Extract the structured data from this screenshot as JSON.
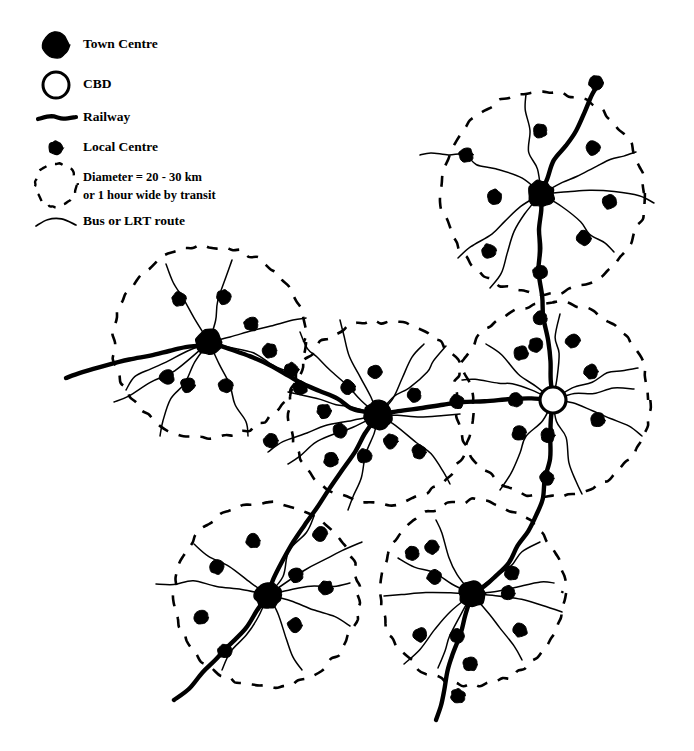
{
  "figure": {
    "kind": "transit-oriented-urban-structure-diagram",
    "background_color": "#ffffff",
    "ink_color": "#000000",
    "width": 694,
    "height": 751
  },
  "legend": {
    "items": [
      {
        "id": "town-centre",
        "label": "Town Centre",
        "symbol": "filled-large-circle",
        "symbol_radius": 13,
        "symbol_x": 56,
        "symbol_y": 45,
        "text_x": 83,
        "text_y": 45,
        "fill": "#000000"
      },
      {
        "id": "cbd",
        "label": "CBD",
        "symbol": "hollow-large-circle",
        "symbol_radius": 13,
        "symbol_x": 56,
        "symbol_y": 85,
        "text_x": 83,
        "text_y": 85,
        "fill": "#ffffff"
      },
      {
        "id": "railway",
        "label": "Railway",
        "symbol": "thick-line",
        "symbol_x": 38,
        "symbol_y": 118,
        "symbol_x2": 76,
        "text_x": 83,
        "text_y": 118,
        "stroke_width": 4.2
      },
      {
        "id": "local-centre",
        "label": "Local Centre",
        "symbol": "filled-small-circle",
        "symbol_radius": 7,
        "symbol_x": 56,
        "symbol_y": 148,
        "text_x": 83,
        "text_y": 148,
        "fill": "#000000"
      },
      {
        "id": "catchment-circle",
        "label": "Diameter = 20 - 30 km",
        "label_line2": "or 1 hour wide by transit",
        "symbol": "dashed-circle",
        "symbol_radius": 21,
        "symbol_x": 56,
        "symbol_y": 185,
        "text_x": 83,
        "text_y": 178,
        "text2_y": 196
      },
      {
        "id": "bus-lrt-route",
        "label": "Bus or LRT route",
        "symbol": "thin-line",
        "symbol_x": 36,
        "symbol_y": 222,
        "symbol_x2": 76,
        "text_x": 83,
        "text_y": 222,
        "stroke_width": 1.4
      }
    ]
  },
  "map": {
    "town_centres": [
      {
        "id": "tc-north-east",
        "x": 541,
        "y": 194,
        "r": 13
      },
      {
        "id": "tc-west",
        "x": 209,
        "y": 342,
        "r": 13
      },
      {
        "id": "tc-central",
        "x": 378,
        "y": 415,
        "r": 14
      },
      {
        "id": "tc-south-west",
        "x": 268,
        "y": 595,
        "r": 13
      },
      {
        "id": "tc-south-east",
        "x": 472,
        "y": 594,
        "r": 13
      }
    ],
    "cbd": {
      "id": "cbd-node",
      "x": 553,
      "y": 400,
      "r": 13
    },
    "catchment_circles": [
      {
        "id": "circle-north-east",
        "cx": 543,
        "cy": 193,
        "r": 101
      },
      {
        "id": "circle-west",
        "cx": 209,
        "cy": 342,
        "r": 96
      },
      {
        "id": "circle-central",
        "cx": 381,
        "cy": 413,
        "r": 92
      },
      {
        "id": "circle-cbd",
        "cx": 552,
        "cy": 400,
        "r": 97
      },
      {
        "id": "circle-south-west",
        "cx": 267,
        "cy": 595,
        "r": 92
      },
      {
        "id": "circle-south-east",
        "cx": 472,
        "cy": 593,
        "r": 92
      }
    ],
    "railways": [
      {
        "id": "railway-west-trunk",
        "points": "66,378 84,372 106,366 128,360 150,355 168,351 186,347 200,344 209,342",
        "stroke_width": 4.4
      },
      {
        "id": "railway-west-to-central",
        "points": "209,342 229,348 250,356 270,366 289,375 305,383 320,392 336,400 352,408 366,412 378,415",
        "stroke_width": 4.4
      },
      {
        "id": "railway-central-to-cbd",
        "points": "378,415 398,411 420,407 442,404 464,402 486,400 510,399 532,399 553,400",
        "stroke_width": 4.4
      },
      {
        "id": "railway-cbd-north",
        "points": "553,400 552,380 550,360 547,340 544,318 542,296 540,272 540,250 540,228 540,210 541,194",
        "stroke_width": 4.4
      },
      {
        "id": "railway-north-spur",
        "points": "541,194 547,178 555,162 565,146 575,130 585,112 593,96 600,82",
        "stroke_width": 4.4
      },
      {
        "id": "railway-cbd-south",
        "points": "553,400 552,420 551,440 549,460 546,480 542,498 536,514 528,530 518,546 508,562 496,576 484,586 472,594",
        "stroke_width": 4.4
      },
      {
        "id": "railway-south-east-tail",
        "points": "472,594 466,614 460,634 454,654 449,672 444,690 440,706 436,720",
        "stroke_width": 4.4
      },
      {
        "id": "railway-central-to-sw",
        "points": "378,415 366,434 354,452 342,470 330,488 318,506 306,524 294,542 282,560 274,578 268,595",
        "stroke_width": 4.4
      },
      {
        "id": "railway-sw-tail",
        "points": "268,595 256,612 244,628 230,644 216,660 202,674 188,688 174,700",
        "stroke_width": 4.4
      }
    ],
    "local_centres": [
      {
        "x": 596,
        "y": 83
      },
      {
        "x": 540,
        "y": 131
      },
      {
        "x": 466,
        "y": 155
      },
      {
        "x": 593,
        "y": 148
      },
      {
        "x": 609,
        "y": 202
      },
      {
        "x": 495,
        "y": 197
      },
      {
        "x": 584,
        "y": 238
      },
      {
        "x": 489,
        "y": 251
      },
      {
        "x": 540,
        "y": 272
      },
      {
        "x": 540,
        "y": 318
      },
      {
        "x": 521,
        "y": 353
      },
      {
        "x": 573,
        "y": 341
      },
      {
        "x": 591,
        "y": 372
      },
      {
        "x": 516,
        "y": 400
      },
      {
        "x": 457,
        "y": 402
      },
      {
        "x": 598,
        "y": 420
      },
      {
        "x": 519,
        "y": 433
      },
      {
        "x": 548,
        "y": 435
      },
      {
        "x": 547,
        "y": 478
      },
      {
        "x": 536,
        "y": 345
      },
      {
        "x": 414,
        "y": 395
      },
      {
        "x": 348,
        "y": 387
      },
      {
        "x": 375,
        "y": 372
      },
      {
        "x": 391,
        "y": 441
      },
      {
        "x": 340,
        "y": 431
      },
      {
        "x": 365,
        "y": 456
      },
      {
        "x": 419,
        "y": 452
      },
      {
        "x": 331,
        "y": 460
      },
      {
        "x": 324,
        "y": 411
      },
      {
        "x": 300,
        "y": 388
      },
      {
        "x": 179,
        "y": 299
      },
      {
        "x": 224,
        "y": 297
      },
      {
        "x": 251,
        "y": 324
      },
      {
        "x": 167,
        "y": 377
      },
      {
        "x": 188,
        "y": 385
      },
      {
        "x": 226,
        "y": 386
      },
      {
        "x": 270,
        "y": 351
      },
      {
        "x": 291,
        "y": 370
      },
      {
        "x": 271,
        "y": 441
      },
      {
        "x": 320,
        "y": 534
      },
      {
        "x": 253,
        "y": 541
      },
      {
        "x": 217,
        "y": 567
      },
      {
        "x": 201,
        "y": 617
      },
      {
        "x": 295,
        "y": 625
      },
      {
        "x": 326,
        "y": 588
      },
      {
        "x": 296,
        "y": 575
      },
      {
        "x": 225,
        "y": 651
      },
      {
        "x": 412,
        "y": 553
      },
      {
        "x": 432,
        "y": 547
      },
      {
        "x": 434,
        "y": 577
      },
      {
        "x": 512,
        "y": 573
      },
      {
        "x": 508,
        "y": 593
      },
      {
        "x": 420,
        "y": 635
      },
      {
        "x": 457,
        "y": 636
      },
      {
        "x": 470,
        "y": 664
      },
      {
        "x": 520,
        "y": 630
      },
      {
        "x": 458,
        "y": 696
      }
    ],
    "bus_routes": [
      "541,194 536,172 532,150 529,128 527,108 526,94",
      "541,194 519,181 498,170 478,162 466,155 450,152 434,152 420,155",
      "541,194 561,183 580,173 594,165 608,158 622,154 636,152",
      "541,194 566,192 590,192 614,194 636,198 654,203",
      "541,194 562,208 580,222 592,234 602,244 614,252",
      "541,194 521,208 504,222 490,236 474,248 458,258",
      "541,194 527,214 516,234 506,254 498,272 490,288",
      "541,194 540,216 540,240 540,262 540,284",
      "553,400 533,392 514,386 496,382 478,380 462,380",
      "553,400 572,389 590,380 606,374 622,370 638,368",
      "553,400 573,405 594,412 612,420 628,428 642,436",
      "553,400 558,420 564,440 570,460 576,478 582,494",
      "553,400 540,419 528,438 518,456 508,474 500,490",
      "553,400 554,378 556,356 558,334 560,314",
      "553,400 534,386 516,372 500,358 486,344",
      "553,400 575,396 596,392 616,390 634,389",
      "378,415 360,400 344,386 330,372 318,358 308,346 300,332",
      "378,415 356,408 336,402 318,398 302,394 288,392",
      "378,415 394,400 410,386 424,372 436,358 446,346",
      "378,415 400,414 422,414 442,414 460,414",
      "378,415 396,428 414,442 428,456 440,470 450,484",
      "378,415 372,436 366,456 360,476 354,494 348,510",
      "378,415 356,424 336,434 318,444 302,454 288,464",
      "378,415 368,394 358,374 350,354 344,336 340,320",
      "378,415 390,396 402,378 414,360 424,344",
      "378,415 352,418 328,424 306,432 286,442 268,452",
      "209,342 196,322 184,302 174,282 166,264",
      "209,342 214,320 220,298 226,278 232,260",
      "209,342 232,334 254,328 274,324 290,320 306,318",
      "209,342 230,348 252,356 272,364 290,372",
      "209,342 220,362 230,382 238,402 244,420 248,436",
      "209,342 196,362 184,382 174,402 166,420 160,436",
      "209,342 188,350 168,360 152,370 138,380 126,390",
      "209,342 172,370 150,384 132,394 114,402",
      "268,595 280,574 292,554 304,534 314,516",
      "268,595 248,580 228,566 210,554 194,544",
      "268,595 242,589 216,585 192,583 172,583 156,584",
      "268,595 290,590 312,586 332,584 350,583",
      "268,595 292,602 314,610 334,618 350,626",
      "268,595 278,616 288,636 296,654 302,670",
      "268,595 256,616 244,636 232,654 222,670",
      "268,595 302,572 324,560 344,550 362,542",
      "472,594 460,574 450,554 442,536 436,520",
      "472,594 452,582 432,572 414,564 398,558",
      "472,594 448,592 424,592 402,594 384,596",
      "472,594 496,590 518,586 538,584 554,583",
      "472,594 498,596 522,600 544,606 562,612",
      "472,594 486,612 500,630 512,646 522,660",
      "472,594 462,614 452,634 444,652 438,668",
      "472,594 452,612 434,630 418,648 404,664",
      "472,594 490,578 508,564 524,552 540,542"
    ]
  }
}
